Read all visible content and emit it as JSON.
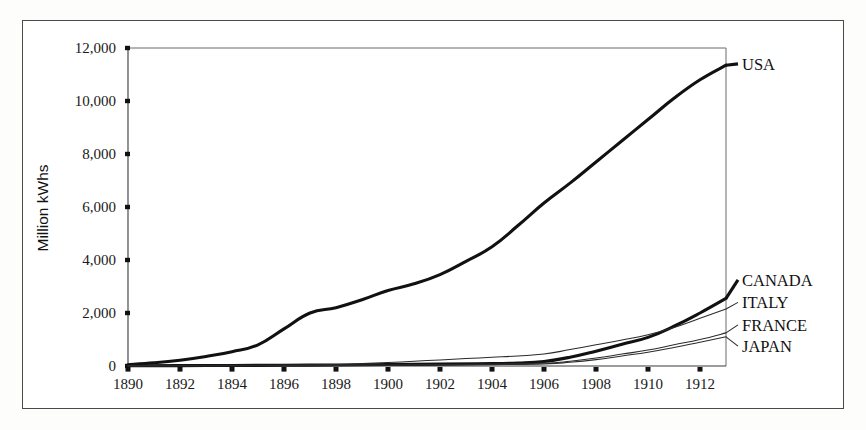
{
  "figure": {
    "background_color": "#ffffff",
    "frame_color": "#4a4a4a"
  },
  "chart_data": {
    "type": "line",
    "title": "",
    "subtitle": "",
    "xlabel": "",
    "ylabel": "Million kWhs",
    "xlim": [
      1890,
      1913
    ],
    "ylim": [
      0,
      12000
    ],
    "grid": false,
    "legend_position": "right-inline-labels",
    "x_ticks": [
      1890,
      1892,
      1894,
      1896,
      1898,
      1900,
      1902,
      1904,
      1906,
      1908,
      1910,
      1912
    ],
    "x_tick_labels": [
      "1890",
      "1892",
      "1894",
      "1896",
      "1898",
      "1900",
      "1902",
      "1904",
      "1906",
      "1908",
      "1910",
      "1912"
    ],
    "y_ticks": [
      0,
      2000,
      4000,
      6000,
      8000,
      10000,
      12000
    ],
    "y_tick_labels": [
      "0",
      "2,000",
      "4,000",
      "6,000",
      "8,000",
      "10,000",
      "12,000"
    ],
    "series": [
      {
        "name": "USA",
        "label": "USA",
        "color": "#111111",
        "width": "thick",
        "label_y_value": 11400,
        "x": [
          1890,
          1891,
          1892,
          1893,
          1894,
          1895,
          1896,
          1897,
          1898,
          1899,
          1900,
          1901,
          1902,
          1903,
          1904,
          1905,
          1906,
          1907,
          1908,
          1909,
          1910,
          1911,
          1912,
          1913
        ],
        "values": [
          50,
          120,
          220,
          360,
          540,
          800,
          1400,
          2000,
          2200,
          2500,
          2850,
          3100,
          3450,
          3950,
          4500,
          5300,
          6150,
          6900,
          7700,
          8500,
          9300,
          10100,
          10800,
          11350
        ]
      },
      {
        "name": "CANADA",
        "label": "CANADA",
        "color": "#111111",
        "width": "thick",
        "label_y_value": 3250,
        "x": [
          1890,
          1892,
          1894,
          1896,
          1898,
          1900,
          1902,
          1904,
          1905,
          1906,
          1907,
          1908,
          1909,
          1910,
          1911,
          1912,
          1913
        ],
        "values": [
          10,
          15,
          20,
          30,
          40,
          55,
          70,
          90,
          110,
          170,
          330,
          560,
          820,
          1080,
          1500,
          2000,
          2550
        ]
      },
      {
        "name": "ITALY",
        "label": "ITALY",
        "color": "#2b2b2b",
        "width": "thin",
        "label_y_value": 2400,
        "x": [
          1890,
          1892,
          1894,
          1896,
          1898,
          1899,
          1900,
          1901,
          1902,
          1903,
          1904,
          1905,
          1906,
          1907,
          1908,
          1909,
          1910,
          1911,
          1912,
          1913
        ],
        "values": [
          15,
          20,
          25,
          35,
          55,
          90,
          130,
          180,
          230,
          280,
          330,
          380,
          450,
          620,
          800,
          980,
          1180,
          1450,
          1800,
          2150
        ]
      },
      {
        "name": "FRANCE",
        "label": "FRANCE",
        "color": "#2b2b2b",
        "width": "thin",
        "label_y_value": 1550,
        "x": [
          1890,
          1892,
          1894,
          1896,
          1898,
          1900,
          1902,
          1904,
          1906,
          1907,
          1908,
          1909,
          1910,
          1911,
          1912,
          1913
        ],
        "values": [
          10,
          12,
          15,
          20,
          28,
          40,
          55,
          75,
          110,
          180,
          300,
          450,
          600,
          800,
          1000,
          1250
        ]
      },
      {
        "name": "JAPAN",
        "label": "JAPAN",
        "color": "#2b2b2b",
        "width": "thin",
        "label_y_value": 750,
        "x": [
          1890,
          1892,
          1894,
          1896,
          1898,
          1900,
          1902,
          1904,
          1906,
          1907,
          1908,
          1909,
          1910,
          1911,
          1912,
          1913
        ],
        "values": [
          5,
          8,
          10,
          14,
          20,
          28,
          40,
          55,
          80,
          140,
          240,
          380,
          520,
          700,
          900,
          1100
        ]
      }
    ]
  }
}
